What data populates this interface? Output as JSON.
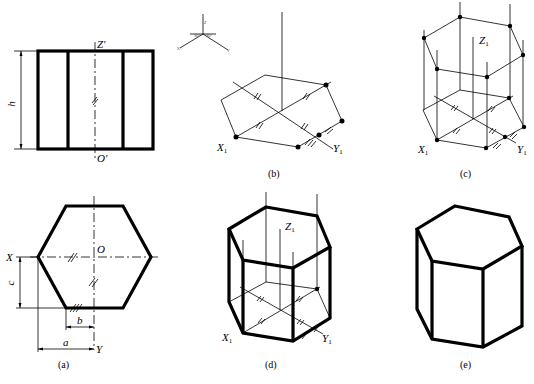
{
  "figure": {
    "type": "engineering drawing",
    "colors": {
      "ink": "#000000",
      "paper": "#ffffff"
    }
  },
  "panels": {
    "a": {
      "caption": "(a)",
      "front_view": {
        "top_label": "Z'",
        "bottom_label": "O'",
        "height_dim": "h"
      },
      "top_view": {
        "center_label": "O",
        "x_label": "X",
        "y_label": "Y",
        "dims": {
          "a": "a",
          "b": "b",
          "c": "c"
        }
      }
    },
    "b": {
      "caption": "(b)",
      "axis_icon": {
        "angles": [
          "30°",
          "30°"
        ],
        "labels": [
          "Z",
          "X",
          "Y"
        ]
      },
      "labels": {
        "x": "X",
        "x_sub": "1",
        "y": "Y",
        "y_sub": "1"
      }
    },
    "c": {
      "caption": "(c)",
      "labels": {
        "z": "Z",
        "z_sub": "1",
        "x": "X",
        "x_sub": "1",
        "y": "Y",
        "y_sub": "1"
      }
    },
    "d": {
      "caption": "(d)",
      "labels": {
        "z": "Z",
        "z_sub": "1",
        "x": "X",
        "x_sub": "1",
        "y": "Y",
        "y_sub": "1"
      }
    },
    "e": {
      "caption": "(e)"
    }
  }
}
